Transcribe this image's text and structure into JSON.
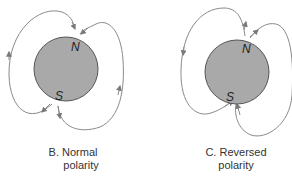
{
  "colors": {
    "planet_fill": "#a9a9a9",
    "planet_stroke": "#555555",
    "field_line": "#8a8a8a",
    "text": "#333333"
  },
  "panels": [
    {
      "id": "B",
      "caption_line1": "B. Normal",
      "caption_line2": "polarity",
      "north_label": "N",
      "south_label": "S",
      "field_direction": "south-to-north (arrows point into N pole)"
    },
    {
      "id": "C",
      "caption_line1": "C. Reversed",
      "caption_line2": "polarity",
      "north_label": "N",
      "south_label": "S",
      "field_direction": "north-to-south (arrows point into S pole)"
    }
  ]
}
